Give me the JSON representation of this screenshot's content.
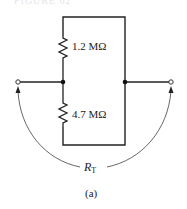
{
  "figure": {
    "caption_top": "FIGURE 62",
    "sublabel": "(a)"
  },
  "circuit": {
    "resistors": [
      {
        "id": "R1",
        "value": "1.2 MΩ"
      },
      {
        "id": "R2",
        "value": "4.7 MΩ"
      }
    ],
    "total_resistance_label": {
      "symbol": "R",
      "subscript": "T"
    },
    "terminals": [
      "left-terminal",
      "right-terminal"
    ],
    "colors": {
      "wire": "#222222",
      "arc": "#555555"
    }
  }
}
